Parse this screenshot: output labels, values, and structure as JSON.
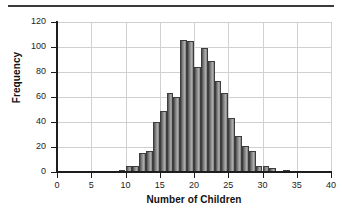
{
  "figure": {
    "rule_present": true
  },
  "chart_data": {
    "type": "bar",
    "title": "",
    "subtitle": "",
    "xlabel": "Number of Children",
    "ylabel": "Frequency",
    "xlim": [
      0,
      40
    ],
    "ylim": [
      0,
      120
    ],
    "xticks": [
      0,
      5,
      10,
      15,
      20,
      25,
      30,
      35,
      40
    ],
    "yticks": [
      0,
      20,
      40,
      60,
      80,
      100,
      120
    ],
    "grid": true,
    "legend": null,
    "bin_width": 1,
    "categories": [
      9,
      10,
      11,
      12,
      13,
      14,
      15,
      16,
      17,
      18,
      19,
      20,
      21,
      22,
      23,
      24,
      25,
      26,
      27,
      28,
      29,
      30,
      31,
      33
    ],
    "values": [
      2,
      5,
      5,
      15,
      17,
      40,
      49,
      63,
      60,
      106,
      105,
      84,
      99,
      89,
      73,
      63,
      43,
      29,
      21,
      17,
      5,
      5,
      3,
      2
    ],
    "bar_color": "#9a9a9a",
    "bar_edge_color": "#3d3d3d",
    "grid_color": "#d0d0d0",
    "axis_color": "#1d1d1d"
  }
}
